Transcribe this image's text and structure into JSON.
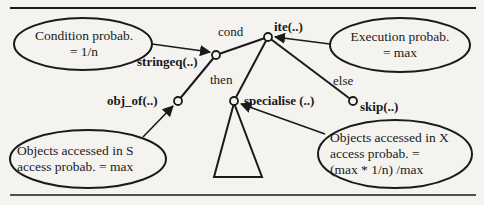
{
  "diagram": {
    "type": "annotated-syntax-tree",
    "nodes": [
      {
        "id": "ite",
        "label": "ite(..)"
      },
      {
        "id": "stringeq",
        "label": "stringeq(..)"
      },
      {
        "id": "obj_of",
        "label": "obj_of(..)"
      },
      {
        "id": "specialise",
        "label": "specialise (..)"
      },
      {
        "id": "skip",
        "label": "skip(..)"
      }
    ],
    "edges": [
      {
        "from": "ite",
        "to": "stringeq",
        "label": "cond"
      },
      {
        "from": "ite",
        "to": "specialise",
        "label": "then"
      },
      {
        "from": "ite",
        "to": "skip",
        "label": "else"
      },
      {
        "from": "stringeq",
        "to": "obj_of",
        "label": ""
      }
    ],
    "edge_labels": {
      "cond": "cond",
      "then": "then",
      "else": "else"
    },
    "annotations": {
      "condition": {
        "lines": [
          "Condition probab.",
          "= 1/n"
        ],
        "points_to": "stringeq"
      },
      "execution": {
        "lines": [
          "Execution probab.",
          "= max"
        ],
        "points_to": "ite"
      },
      "objects_s": {
        "lines": [
          "Objects accessed in S",
          "access probab. = max"
        ],
        "points_to": "obj_of"
      },
      "objects_x": {
        "lines": [
          "Objects accessed in X",
          "access probab. =",
          "(max * 1/n) /max"
        ],
        "points_to": "specialise"
      }
    },
    "subtree": {
      "shape": "triangle",
      "root": "specialise"
    },
    "colors": {
      "ink": "#1a1a1a",
      "background": "#f4f3f0"
    }
  }
}
